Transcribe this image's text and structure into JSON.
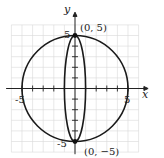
{
  "chart_data": {
    "type": "line",
    "title": "",
    "xlabel": "x",
    "ylabel": "y",
    "xlim": [
      -6,
      6
    ],
    "ylim": [
      -6,
      6
    ],
    "grid": true,
    "tick_labels": {
      "x": [
        "-5",
        "5"
      ],
      "y": [
        "5",
        "-5"
      ]
    },
    "series": [
      {
        "name": "circle",
        "shape": "circle",
        "center": [
          0,
          0
        ],
        "radius": 5
      },
      {
        "name": "ellipse",
        "shape": "ellipse",
        "center": [
          0,
          0
        ],
        "semi_x": 1,
        "semi_y": 5
      }
    ],
    "points": [
      {
        "x": 0,
        "y": 5,
        "label": "(0, 5)"
      },
      {
        "x": 0,
        "y": -5,
        "label": "(0, −5)"
      }
    ],
    "colors": {
      "curve": "#1a1a1a",
      "grid": "#d4d4d4",
      "axis": "#222222"
    }
  }
}
